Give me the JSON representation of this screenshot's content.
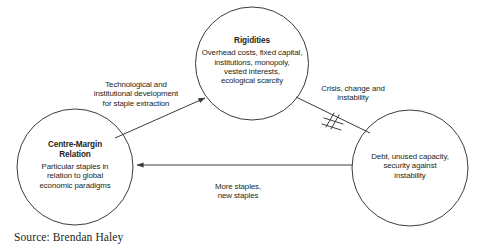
{
  "figure": {
    "caption": "Source: Brendan Haley",
    "stroke_color": "#3b3b3b",
    "text_color": "#231f20",
    "background": "#ffffff"
  },
  "nodes": [
    {
      "id": "rigidities",
      "title": "Rigidities",
      "body": "Overhead costs, fixed capital,\ninstitutions, monopoly,\nvested interests,\necological scarcity"
    },
    {
      "id": "centre-margin",
      "title": "Centre-Margin\nRelation",
      "body": "Particular staples in\nrelation to global\neconomic paradigms"
    },
    {
      "id": "debt",
      "title": "",
      "body": "Debt, unused capacity,\nsecurity against\ninstability"
    }
  ],
  "edges": [
    {
      "id": "technological",
      "label": "Technological and\ninstitutional development\nfor staple extraction",
      "from": "centre-margin",
      "to": "rigidities",
      "break_mark": false
    },
    {
      "id": "crisis",
      "label": "Crisis, change and\ninstability",
      "from": "rigidities",
      "to": "debt",
      "break_mark": true
    },
    {
      "id": "more-staples",
      "label": "More staples,\nnew staples",
      "from": "debt",
      "to": "centre-margin",
      "break_mark": false
    }
  ]
}
